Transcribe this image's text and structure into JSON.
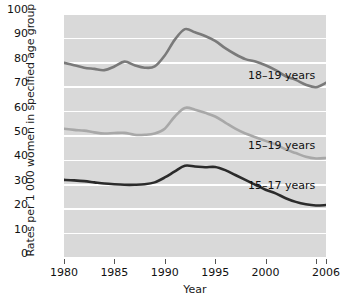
{
  "chart_data": {
    "type": "line",
    "title": "",
    "xlabel": "Year",
    "ylabel": "Rates per 1 000 women in specified age group",
    "xlim": [
      1980,
      2006
    ],
    "ylim": [
      0,
      100
    ],
    "grid": true,
    "legend_position": "inline-right",
    "xticklabels": [
      "1980",
      "1985",
      "1990",
      "1995",
      "2000",
      "2006"
    ],
    "xtickvalues": [
      1980,
      1985,
      1990,
      1995,
      2000,
      2006
    ],
    "extra_xtickvalues": [
      2005
    ],
    "yticklabels": [
      "0",
      "10",
      "20",
      "30",
      "40",
      "50",
      "60",
      "70",
      "80",
      "90",
      "100"
    ],
    "ytickvalues": [
      0,
      10,
      20,
      30,
      40,
      50,
      60,
      70,
      80,
      90,
      100
    ],
    "x": [
      1980,
      1981,
      1982,
      1983,
      1984,
      1985,
      1986,
      1987,
      1988,
      1989,
      1990,
      1991,
      1992,
      1993,
      1994,
      1995,
      1996,
      1997,
      1998,
      1999,
      2000,
      2001,
      2002,
      2003,
      2004,
      2005,
      2006
    ],
    "series": [
      {
        "name": "18–19 years",
        "color": "#7a7a7a",
        "values": [
          80.0,
          79.0,
          78.0,
          77.5,
          77.0,
          78.5,
          80.5,
          79.0,
          78.0,
          78.5,
          83.0,
          89.5,
          93.8,
          92.5,
          91.0,
          89.0,
          86.0,
          83.5,
          81.5,
          80.5,
          79.0,
          77.0,
          74.5,
          73.0,
          71.0,
          70.0,
          71.8
        ],
        "label_text": "18–19 years"
      },
      {
        "name": "15–19 years",
        "color": "#a8a8a8",
        "values": [
          53.0,
          52.5,
          52.2,
          51.5,
          51.0,
          51.2,
          51.3,
          50.5,
          50.5,
          51.0,
          53.0,
          58.0,
          61.5,
          60.8,
          59.5,
          58.0,
          55.5,
          53.0,
          51.0,
          49.5,
          48.0,
          46.5,
          44.5,
          43.0,
          41.5,
          40.8,
          41.0
        ],
        "label_text": "15–19 years"
      },
      {
        "name": "15–17 years",
        "color": "#2b2b2b",
        "values": [
          32.0,
          31.8,
          31.5,
          31.0,
          30.5,
          30.2,
          30.0,
          30.0,
          30.2,
          31.0,
          33.0,
          35.5,
          37.8,
          37.5,
          37.2,
          37.3,
          36.0,
          34.0,
          32.0,
          30.0,
          28.0,
          26.5,
          24.5,
          23.0,
          22.0,
          21.5,
          21.7
        ],
        "label_text": "15–17 years"
      }
    ]
  },
  "axes": {
    "ylabel_text": "Rates per 1 000 women in specified age group",
    "xlabel_text": "Year"
  },
  "colors": {
    "panel_background": "#d9d9d9",
    "gridline": "#ffffff",
    "page_background": "#ffffff",
    "text": "#111111"
  }
}
